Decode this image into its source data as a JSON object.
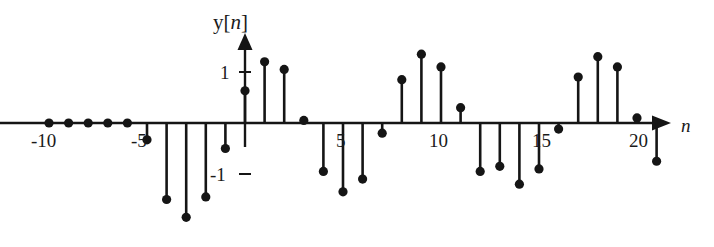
{
  "chart_data": {
    "type": "scatter",
    "plot_style": "stem",
    "title": "",
    "ylabel": "y[n]",
    "xlabel": "n",
    "xlim": [
      -11.5,
      23.0
    ],
    "ylim": [
      -2.0,
      1.6
    ],
    "grid": false,
    "legend": null,
    "x_tick_labels": [
      "-10",
      "-5",
      "5",
      "10",
      "15",
      "20"
    ],
    "x_ticks": [
      -10,
      -5,
      5,
      10,
      15,
      20
    ],
    "y_tick_labels": [
      "1",
      "-1"
    ],
    "y_ticks": [
      1,
      -1
    ],
    "x": [
      -10,
      -9,
      -8,
      -7,
      -6,
      -5,
      -4,
      -3,
      -2,
      -1,
      0,
      1,
      2,
      3,
      4,
      5,
      6,
      7,
      8,
      9,
      10,
      11,
      12,
      13,
      14,
      15,
      16,
      17,
      18,
      19,
      20,
      21
    ],
    "values": [
      0,
      0,
      0,
      0,
      0,
      -0.33,
      -1.5,
      -1.85,
      -1.45,
      -0.5,
      0.63,
      1.2,
      1.05,
      0.05,
      -0.95,
      -1.35,
      -1.1,
      -0.2,
      0.85,
      1.35,
      1.1,
      0.3,
      -0.95,
      -0.85,
      -1.2,
      -0.9,
      -0.12,
      0.9,
      1.3,
      1.1,
      0.1,
      -0.75
    ],
    "marker": "filled-circle",
    "marker_color": "#151515",
    "stem_color": "#151515",
    "axis_color": "#151515"
  },
  "axes": {
    "y_title": {
      "prefix": "y[",
      "var": "n",
      "suffix": "]"
    },
    "x_title": "n",
    "y_tick_pos": "1",
    "y_tick_neg": "-1",
    "x_tick_m10": "-10",
    "x_tick_m5": "-5",
    "x_tick_5": "5",
    "x_tick_10": "10",
    "x_tick_15": "15",
    "x_tick_20": "20"
  },
  "geometry": {
    "origin_x": 245,
    "baseline_y": 123,
    "x_step": 19.6,
    "y_unit": 51,
    "dot_radius": 4.6,
    "stem_width": 2.6,
    "axis_width": 2.4
  }
}
